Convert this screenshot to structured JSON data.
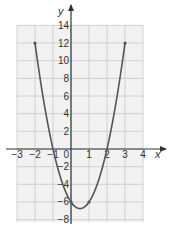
{
  "chart_data": {
    "type": "line",
    "title": "",
    "xlabel": "x",
    "ylabel": "y",
    "xlim": [
      -3,
      4
    ],
    "ylim": [
      -8,
      14
    ],
    "grid": true,
    "x_ticks": [
      -3,
      -2,
      -1,
      0,
      1,
      2,
      3,
      4
    ],
    "x_tick_labels": [
      "−3",
      "−2",
      "−1",
      "0",
      "1",
      "2",
      "3",
      "4"
    ],
    "y_ticks": [
      14,
      12,
      10,
      8,
      6,
      4,
      2,
      -2,
      -4,
      -6,
      -8
    ],
    "y_tick_labels": [
      "14",
      "12",
      "10",
      "8",
      "6",
      "4",
      "2",
      "−2",
      "−4",
      "−6",
      "−8"
    ],
    "series": [
      {
        "name": "parabola",
        "function": "y = 3x^2 - 3x - 6",
        "x": [
          -2,
          -1.5,
          -1,
          -0.5,
          0,
          0.5,
          1,
          1.5,
          2,
          2.5,
          3
        ],
        "values": [
          12,
          5.25,
          0,
          -3.75,
          -6,
          -6.75,
          -6,
          -3.75,
          0,
          5.25,
          12
        ],
        "marked_points": [
          [
            -2,
            12
          ],
          [
            0,
            -6
          ],
          [
            1,
            -6
          ],
          [
            3,
            12
          ]
        ]
      }
    ]
  },
  "colors": {
    "grid": "#c8c8c8",
    "grid_bg": "#f2f2f2",
    "axis": "#333333",
    "curve": "#555555"
  }
}
